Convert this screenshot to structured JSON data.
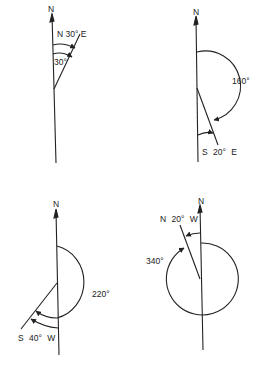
{
  "panels": [
    {
      "north": "N",
      "bearing": "N 30° E",
      "angle": "30°"
    },
    {
      "north": "N",
      "bearing": "S 20° E",
      "angle": "160°"
    },
    {
      "north": "N",
      "bearing": "S 40° W",
      "angle": "220°"
    },
    {
      "north": "N",
      "bearing": "N 20° W",
      "angle": "340°"
    }
  ],
  "colors": {
    "ink": "#222222",
    "background": "#ffffff"
  }
}
